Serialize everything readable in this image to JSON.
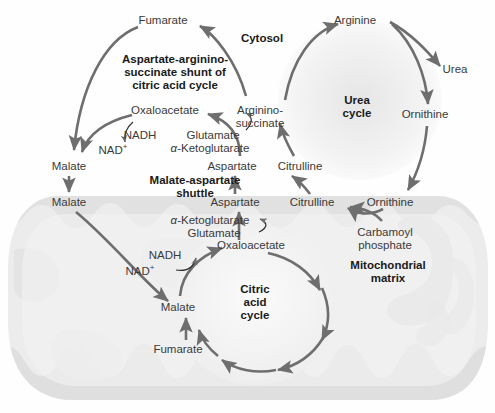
{
  "figure": {
    "type": "biochemical-pathway-diagram",
    "compartments": [
      {
        "name": "Cytosol",
        "label": "Cytosol"
      },
      {
        "name": "Mitochondrial matrix",
        "label": "Mitochondrial\nmatrix"
      }
    ]
  },
  "cycle_titles": {
    "shunt": "Aspartate-arginino-\nsuccinate shunt of\ncitric acid cycle",
    "urea": "Urea\ncycle",
    "shuttle": "Malate-aspartate\nshuttle",
    "citric": "Citric\nacid\ncycle",
    "matrix": "Mitochondrial\nmatrix",
    "cytosol": "Cytosol"
  },
  "metabolites": {
    "cytosol": [
      {
        "id": "fumarate-cyt",
        "label": "Fumarate",
        "x": 163,
        "y": 21
      },
      {
        "id": "arginine",
        "label": "Arginine",
        "x": 355,
        "y": 21
      },
      {
        "id": "urea",
        "label": "Urea",
        "x": 455,
        "y": 70
      },
      {
        "id": "ornithine-cyt",
        "label": "Ornithine",
        "x": 425,
        "y": 115
      },
      {
        "id": "oxaloacetate-cyt",
        "label": "Oxaloacetate",
        "x": 165,
        "y": 111
      },
      {
        "id": "argininosuccinate",
        "label": "Arginino-\nsuccinate",
        "x": 260,
        "y": 106
      },
      {
        "id": "nadh-cyt",
        "label": "NADH",
        "x": 140,
        "y": 136
      },
      {
        "id": "nad-cyt",
        "label": "NAD",
        "sup": "+",
        "x": 113,
        "y": 149
      },
      {
        "id": "glutamate-cyt",
        "label": "Glutamate",
        "x": 213,
        "y": 136
      },
      {
        "id": "alpha-ketoglutarate-cyt",
        "label": "-Ketoglutarate",
        "prefix": "α",
        "x": 210,
        "y": 148
      },
      {
        "id": "malate-cyt",
        "label": "Malate",
        "x": 69,
        "y": 167
      },
      {
        "id": "aspartate-cyt",
        "label": "Aspartate",
        "x": 232,
        "y": 167
      },
      {
        "id": "citrulline-cyt",
        "label": "Citrulline",
        "x": 300,
        "y": 167
      }
    ],
    "matrix": [
      {
        "id": "malate-mito",
        "label": "Malate",
        "x": 69,
        "y": 202
      },
      {
        "id": "aspartate-mito",
        "label": "Aspartate",
        "x": 235,
        "y": 202
      },
      {
        "id": "citrulline-mito",
        "label": "Citrulline",
        "x": 312,
        "y": 202
      },
      {
        "id": "ornithine-mito",
        "label": "Ornithine",
        "x": 390,
        "y": 202
      },
      {
        "id": "alpha-ketoglutarate-mito",
        "label": "-Ketoglutarate",
        "prefix": "α",
        "x": 210,
        "y": 220
      },
      {
        "id": "glutamate-mito",
        "label": "Glutamate",
        "x": 214,
        "y": 233
      },
      {
        "id": "oxaloacetate-mito",
        "label": "Oxaloacetate",
        "x": 251,
        "y": 245
      },
      {
        "id": "carbamoyl-phosphate",
        "label": "Carbamoyl\nphosphate",
        "x": 385,
        "y": 232
      },
      {
        "id": "nadh-mito",
        "label": "NADH",
        "x": 165,
        "y": 256
      },
      {
        "id": "nad-mito",
        "label": "NAD",
        "sup": "+",
        "x": 140,
        "y": 270
      },
      {
        "id": "malate-mito-2",
        "label": "Malate",
        "x": 178,
        "y": 307
      },
      {
        "id": "fumarate-mito",
        "label": "Fumarate",
        "x": 178,
        "y": 349
      }
    ]
  },
  "colors": {
    "arrow": "#6e6e6e",
    "text": "#3a3a3a",
    "bold_text": "#1a1a1a",
    "mito_fill": "#ececec",
    "cristae": "#dcdcdc",
    "background": "#fefefe"
  }
}
